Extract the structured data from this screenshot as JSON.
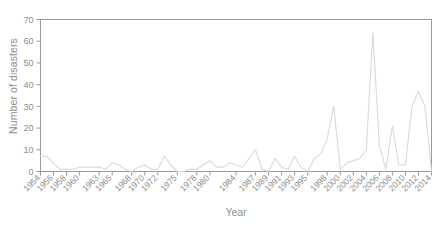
{
  "chart_data": {
    "type": "line",
    "title": "",
    "xlabel": "Year",
    "ylabel": "Number of disasters",
    "grid": false,
    "legend": false,
    "legend_position": "none",
    "line_color": "#d9d9d9",
    "axis_color": "#9a9a9a",
    "background": "#ffffff",
    "xlim": [
      1954,
      2014
    ],
    "ylim": [
      0,
      70
    ],
    "ytick_values": [
      0,
      10,
      20,
      30,
      40,
      50,
      60,
      70
    ],
    "ytick_labels": [
      "0",
      "10",
      "20",
      "30",
      "40",
      "50",
      "60",
      "70"
    ],
    "xtick_values": [
      1954,
      1956,
      1958,
      1960,
      1963,
      1965,
      1968,
      1970,
      1972,
      1975,
      1978,
      1980,
      1984,
      1987,
      1989,
      1991,
      1993,
      1995,
      1998,
      2000,
      2002,
      2004,
      2006,
      2008,
      2010,
      2012,
      2014
    ],
    "xtick_labels": [
      "1954",
      "1956",
      "1958",
      "1960",
      "1963",
      "1965",
      "1968",
      "1970",
      "1972",
      "1975",
      "1978",
      "1980",
      "1984",
      "1987",
      "1989",
      "1991",
      "1993",
      "1995",
      "1998",
      "2000",
      "2002",
      "2004",
      "2006",
      "2008",
      "2010",
      "2012",
      "2014"
    ],
    "x": [
      1954,
      1955,
      1956,
      1957,
      1958,
      1959,
      1960,
      1961,
      1962,
      1963,
      1964,
      1965,
      1966,
      1967,
      1968,
      1969,
      1970,
      1971,
      1972,
      1973,
      1974,
      1975,
      1976,
      1977,
      1978,
      1979,
      1980,
      1981,
      1982,
      1983,
      1984,
      1985,
      1986,
      1987,
      1988,
      1989,
      1990,
      1991,
      1992,
      1993,
      1994,
      1995,
      1996,
      1997,
      1998,
      1999,
      2000,
      2001,
      2002,
      2003,
      2004,
      2005,
      2006,
      2007,
      2008,
      2009,
      2010,
      2011,
      2012,
      2013,
      2014
    ],
    "values": [
      7,
      7,
      4,
      1,
      1,
      1,
      2,
      2,
      2,
      2,
      1,
      4,
      3,
      1,
      0,
      2,
      3,
      1,
      1,
      7,
      3,
      0,
      0,
      1,
      1,
      3,
      5,
      2,
      2,
      4,
      3,
      2,
      6,
      10,
      1,
      0,
      6,
      2,
      1,
      7,
      2,
      0,
      6,
      8,
      15,
      30,
      1,
      4,
      5,
      6,
      10,
      64,
      12,
      1,
      21,
      3,
      3,
      30,
      37,
      30,
      0
    ],
    "series": [
      {
        "name": "Number of disasters",
        "color": "#d9d9d9",
        "values": [
          7,
          7,
          4,
          1,
          1,
          1,
          2,
          2,
          2,
          2,
          1,
          4,
          3,
          1,
          0,
          2,
          3,
          1,
          1,
          7,
          3,
          0,
          0,
          1,
          1,
          3,
          5,
          2,
          2,
          4,
          3,
          2,
          6,
          10,
          1,
          0,
          6,
          2,
          1,
          7,
          2,
          0,
          6,
          8,
          15,
          30,
          1,
          4,
          5,
          6,
          10,
          64,
          12,
          1,
          21,
          3,
          3,
          30,
          37,
          30,
          0
        ]
      }
    ],
    "annotations": []
  }
}
